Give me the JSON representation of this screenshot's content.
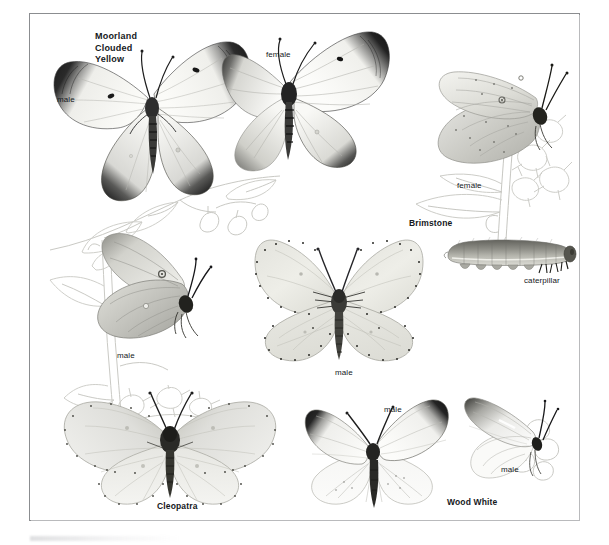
{
  "plate": {
    "kind": "field-guide-illustration-plate",
    "subject": "butterflies",
    "background_color": "#ffffff",
    "frame_color": "#8b8d90"
  },
  "titles": [
    {
      "id": "moorland-clouded-yellow",
      "text": "Moorland\nClouded\nYellow",
      "lines": [
        "Moorland",
        "Clouded",
        "Yellow"
      ],
      "x": 95,
      "y": 31
    },
    {
      "id": "brimstone",
      "text": "Brimstone",
      "x": 409,
      "y": 219
    },
    {
      "id": "cleopatra",
      "text": "Cleopatra",
      "x": 157,
      "y": 502
    },
    {
      "id": "wood-white",
      "text": "Wood White",
      "x": 447,
      "y": 498
    }
  ],
  "labels": [
    {
      "id": "mcy-male-upper",
      "text": "male",
      "x": 57,
      "y": 95
    },
    {
      "id": "mcy-female-upper",
      "text": "female",
      "x": 266,
      "y": 50
    },
    {
      "id": "mcy-female-resting",
      "text": "female",
      "x": 457,
      "y": 181
    },
    {
      "id": "mcy-male-resting",
      "text": "male",
      "x": 117,
      "y": 351
    },
    {
      "id": "brimstone-male",
      "text": "male",
      "x": 335,
      "y": 368
    },
    {
      "id": "brimstone-caterpillar",
      "text": "caterpillar",
      "x": 524,
      "y": 276
    },
    {
      "id": "wood-white-male-open",
      "text": "male",
      "x": 384,
      "y": 405
    },
    {
      "id": "wood-white-male-resting",
      "text": "male",
      "x": 501,
      "y": 465
    }
  ],
  "figures": [
    {
      "id": "moorland-clouded-yellow-male-upperside",
      "species": "Moorland Clouded Yellow",
      "sex": "male",
      "view": "upperside",
      "wing_color": "#f2f2ef",
      "border_color": "#161616"
    },
    {
      "id": "moorland-clouded-yellow-female-upperside",
      "species": "Moorland Clouded Yellow",
      "sex": "female",
      "view": "upperside",
      "wing_color": "#f4f4f1",
      "border_color": "#1a1a1a"
    },
    {
      "id": "moorland-clouded-yellow-female-underside",
      "species": "Moorland Clouded Yellow",
      "sex": "female",
      "view": "resting on plant",
      "wing_color": "#dcdcd6"
    },
    {
      "id": "moorland-clouded-yellow-male-underside",
      "species": "Moorland Clouded Yellow",
      "sex": "male",
      "view": "resting on plant",
      "wing_color": "#d2d2cc"
    },
    {
      "id": "brimstone-male-upperside",
      "species": "Brimstone",
      "sex": "male",
      "view": "upperside",
      "wing_color": "#e9e9e3"
    },
    {
      "id": "brimstone-caterpillar",
      "species": "Brimstone",
      "stage": "caterpillar",
      "body_color": "#9a9a93"
    },
    {
      "id": "cleopatra-male-upperside",
      "species": "Cleopatra",
      "sex": "male",
      "view": "upperside",
      "wing_color": "#ececE6"
    },
    {
      "id": "wood-white-male-upperside",
      "species": "Wood White",
      "sex": "male",
      "view": "upperside",
      "wing_color": "#f7f7f5",
      "tip_color": "#1d1d1d"
    },
    {
      "id": "wood-white-male-underside",
      "species": "Wood White",
      "sex": "male",
      "view": "resting on flower",
      "wing_color": "#f8f8f6"
    }
  ]
}
